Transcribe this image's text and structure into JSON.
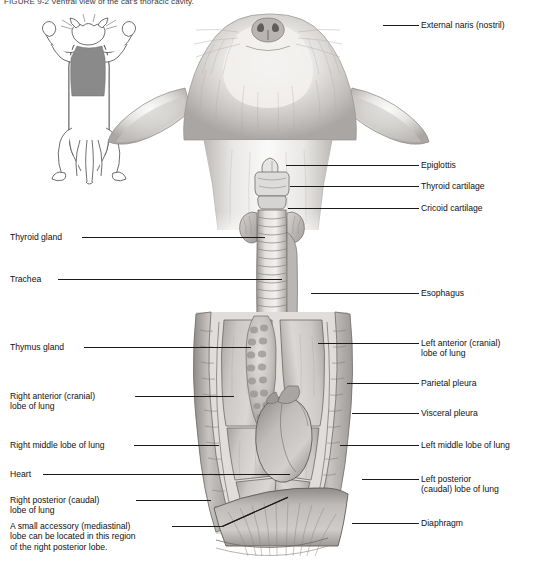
{
  "figure": {
    "title": "FIGURE 9-2   Ventral view of the cat's thoracic cavity.",
    "style": "grayscale pencil anatomical illustration"
  },
  "inset": {
    "name": "orientation-diagram",
    "description": "Line drawing of cat in dorsal recumbency with shaded thoracic region",
    "shade_color": "#8a8a8a"
  },
  "labels_right": [
    {
      "id": "external-naris",
      "text": "External naris (nostril)",
      "x": 421,
      "y": 20,
      "leader": {
        "x": 383,
        "y": 25,
        "w": 36
      }
    },
    {
      "id": "epiglottis",
      "text": "Epiglottis",
      "x": 421,
      "y": 160,
      "leader": {
        "x": 286,
        "y": 165,
        "w": 133
      }
    },
    {
      "id": "thyroid-cartilage",
      "text": "Thyroid cartilage",
      "x": 421,
      "y": 181,
      "leader": {
        "x": 290,
        "y": 186,
        "w": 129
      }
    },
    {
      "id": "cricoid-cartilage",
      "text": "Cricoid cartilage",
      "x": 421,
      "y": 203,
      "leader": {
        "x": 288,
        "y": 208,
        "w": 131
      }
    },
    {
      "id": "esophagus",
      "text": "Esophagus",
      "x": 421,
      "y": 288,
      "leader": {
        "x": 311,
        "y": 293,
        "w": 108
      }
    },
    {
      "id": "left-anterior-lobe",
      "text": "Left anterior (cranial)\nlobe of lung",
      "x": 421,
      "y": 338,
      "leader": {
        "x": 318,
        "y": 343,
        "w": 101
      }
    },
    {
      "id": "parietal-pleura",
      "text": "Parietal pleura",
      "x": 421,
      "y": 378,
      "leader": {
        "x": 347,
        "y": 383,
        "w": 72
      }
    },
    {
      "id": "visceral-pleura",
      "text": "Visceral pleura",
      "x": 421,
      "y": 408,
      "leader": {
        "x": 352,
        "y": 413,
        "w": 67
      }
    },
    {
      "id": "left-middle-lobe",
      "text": "Left middle lobe of lung",
      "x": 421,
      "y": 440,
      "leader": {
        "x": 340,
        "y": 445,
        "w": 79
      }
    },
    {
      "id": "left-posterior-lobe",
      "text": "Left posterior\n(caudal) lobe of lung",
      "x": 421,
      "y": 474,
      "leader": {
        "x": 362,
        "y": 479,
        "w": 57
      }
    },
    {
      "id": "diaphragm",
      "text": "Diaphragm",
      "x": 421,
      "y": 518,
      "leader": {
        "x": 352,
        "y": 523,
        "w": 67
      }
    }
  ],
  "labels_left": [
    {
      "id": "thyroid-gland",
      "text": "Thyroid gland",
      "x": 10,
      "y": 232,
      "leader": {
        "x": 82,
        "y": 237,
        "w": 183
      }
    },
    {
      "id": "trachea",
      "text": "Trachea",
      "x": 10,
      "y": 274,
      "leader": {
        "x": 58,
        "y": 279,
        "w": 224
      }
    },
    {
      "id": "thymus-gland",
      "text": "Thymus gland",
      "x": 10,
      "y": 342,
      "leader": {
        "x": 84,
        "y": 347,
        "w": 167
      }
    },
    {
      "id": "right-anterior-lobe",
      "text": "Right anterior (cranial)\nlobe of lung",
      "x": 10,
      "y": 391,
      "leader": {
        "x": 135,
        "y": 396,
        "w": 99
      }
    },
    {
      "id": "right-middle-lobe",
      "text": "Right middle lobe of lung",
      "x": 10,
      "y": 440,
      "leader": {
        "x": 134,
        "y": 445,
        "w": 85
      }
    },
    {
      "id": "heart",
      "text": "Heart",
      "x": 10,
      "y": 469,
      "leader": {
        "x": 43,
        "y": 474,
        "w": 247
      }
    },
    {
      "id": "right-posterior-lobe",
      "text": "Right posterior (caudal)\nlobe of lung",
      "x": 10,
      "y": 495,
      "leader": {
        "x": 136,
        "y": 500,
        "w": 75
      }
    },
    {
      "id": "accessory-lobe-note",
      "text": "A small accessory (mediastinal)\nlobe can be located in this region\nof the right posterior lobe.",
      "x": 10,
      "y": 521,
      "leader": {
        "x": 172,
        "y": 526,
        "w": 50
      }
    }
  ],
  "structures": [
    "external naris",
    "epiglottis",
    "thyroid cartilage",
    "cricoid cartilage",
    "thyroid gland",
    "trachea",
    "esophagus",
    "thymus gland",
    "right anterior lobe of lung",
    "right middle lobe of lung",
    "right posterior lobe of lung",
    "left anterior lobe of lung",
    "left middle lobe of lung",
    "left posterior lobe of lung",
    "heart",
    "diaphragm",
    "parietal pleura",
    "visceral pleura"
  ],
  "colors": {
    "ink": "#1b1b1b",
    "tissue_light": "#d8d6d4",
    "tissue_mid": "#b4b1ae",
    "tissue_dark": "#8d8a87",
    "fur_light": "#eceae8",
    "fur_mid": "#c9c6c3"
  }
}
